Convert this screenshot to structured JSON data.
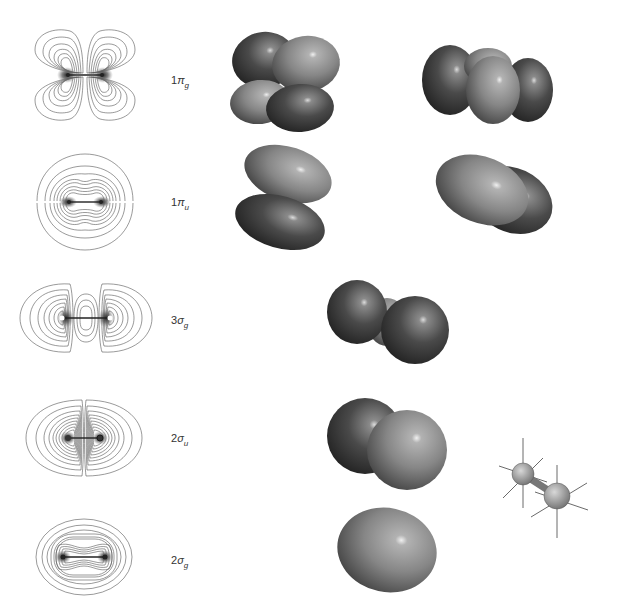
{
  "colors": {
    "contour_line": "#555555",
    "lobe_dark": "#3a3a3a",
    "lobe_light": "#8a8a8a",
    "background": "#ffffff"
  },
  "orbitals": [
    {
      "id": "1pi_g",
      "number": "1",
      "symbol": "π",
      "subscript": "g",
      "label": "1πg",
      "contour_type": "pi-antibonding",
      "isosurface_views": 2
    },
    {
      "id": "1pi_u",
      "number": "1",
      "symbol": "π",
      "subscript": "u",
      "label": "1πu",
      "contour_type": "pi-bonding",
      "isosurface_views": 2
    },
    {
      "id": "3sigma_g",
      "number": "3",
      "symbol": "σ",
      "subscript": "g",
      "label": "3σg",
      "contour_type": "sigma-3g",
      "isosurface_views": 1
    },
    {
      "id": "2sigma_u",
      "number": "2",
      "symbol": "σ",
      "subscript": "u",
      "label": "2σu",
      "contour_type": "sigma-antibonding",
      "isosurface_views": 1
    },
    {
      "id": "2sigma_g",
      "number": "2",
      "symbol": "σ",
      "subscript": "g",
      "label": "2σg",
      "contour_type": "sigma-bonding",
      "isosurface_views": 1
    }
  ],
  "molecule_model": {
    "description": "ball-and-stick diatomic with axis spokes",
    "atoms": 2
  }
}
